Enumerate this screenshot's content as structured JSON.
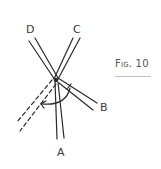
{
  "figure": {
    "caption": "Fig. 10"
  },
  "labels": {
    "a": "A",
    "b": "B",
    "c": "C",
    "d": "D"
  },
  "colors": {
    "stroke": "#2a2a2a",
    "caption_rule": "#bfbfbf"
  }
}
